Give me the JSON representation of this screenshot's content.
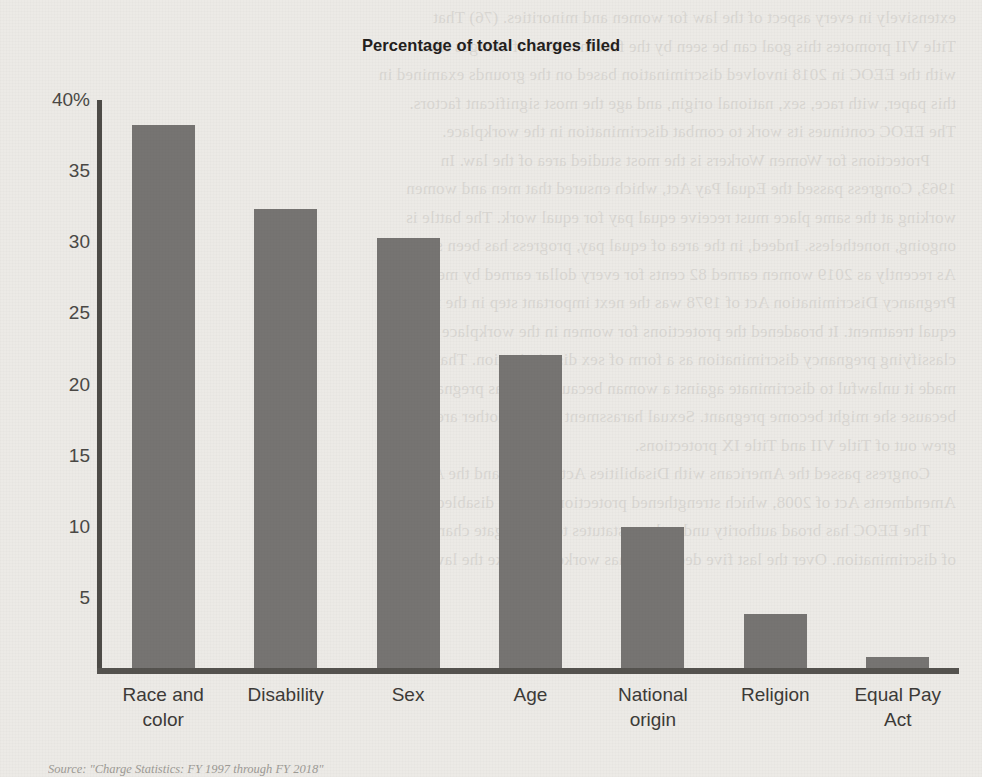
{
  "chart_data": {
    "type": "bar",
    "title": "Percentage of total charges filed",
    "xlabel": "",
    "ylabel": "",
    "ylim": [
      0,
      40
    ],
    "yticks": [
      "5",
      "10",
      "15",
      "20",
      "25",
      "30",
      "35",
      "40%"
    ],
    "ytick_values": [
      5,
      10,
      15,
      20,
      25,
      30,
      35,
      40
    ],
    "grid": false,
    "legend": false,
    "bar_color": "#767472",
    "axis_color": "#55534f",
    "categories": [
      "Race and\ncolor",
      "Disability",
      "Sex",
      "Age",
      "National\norigin",
      "Religion",
      "Equal Pay\nAct"
    ],
    "category_lines": [
      [
        "Race and",
        "color"
      ],
      [
        "Disability",
        ""
      ],
      [
        "Sex",
        ""
      ],
      [
        "Age",
        ""
      ],
      [
        "National",
        "origin"
      ],
      [
        "Religion",
        ""
      ],
      [
        "Equal Pay",
        "Act"
      ]
    ],
    "values": [
      38.2,
      32.3,
      30.2,
      22.0,
      9.9,
      3.8,
      0.8
    ]
  },
  "chart": {
    "title": "Percentage of total charges filed"
  },
  "source": {
    "note": "Source: \"Charge Statistics: FY 1997 through FY 2018\""
  },
  "bleed": {
    "lines": [
      "extensively in every aspect of the law for women and minorities. (76) That",
      "Title VII promotes this goal can be seen by the fact that 85% of charges filed",
      "with the EEOC in 2018 involved discrimination based on the grounds examined in",
      "this paper, with race, sex, national origin, and age the most significant factors.",
      "The EEOC continues its work to combat discrimination in the workplace.",
      "Protections for Women Workers is the most studied area of the law. In",
      "1963, Congress passed the Equal Pay Act, which ensured that men and women",
      "working at the same place must receive equal pay for equal work. The battle is",
      "ongoing, nonetheless. Indeed, in the area of equal pay, progress has been slow.",
      "As recently as 2019 women earned 82 cents for every dollar earned by men. The",
      "Pregnancy Discrimination Act of 1978 was the next important step in the fight for",
      "equal treatment. It broadened the protections for women in the workplace by",
      "classifying pregnancy discrimination as a form of sex discrimination. That law",
      "made it unlawful to discriminate against a woman because she was pregnant or",
      "because she might become pregnant. Sexual harassment law is another area that",
      "grew out of Title VII and Title IX protections.",
      "Congress passed the Americans with Disabilities Act in 1990 and the ADA",
      "Amendments Act of 2008, which strengthened protections for the disabled.",
      "The EEOC has broad authority under these statutes to investigate charges",
      "of discrimination. Over the last five decades it has worked to make the law work."
    ]
  }
}
